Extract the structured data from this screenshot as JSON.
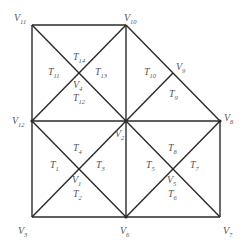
{
  "diagram": {
    "type": "triangulated-mesh",
    "colors": {
      "edge": "#2a2a2a",
      "label": "#555555",
      "background": "#ffffff"
    },
    "vertices": [
      {
        "id": "V1",
        "base": "V",
        "sub": "1",
        "x": 79,
        "y": 169,
        "lx": 72,
        "ly": 183
      },
      {
        "id": "V2",
        "base": "V",
        "sub": "2",
        "x": 126,
        "y": 121,
        "lx": 115,
        "ly": 137
      },
      {
        "id": "V3",
        "base": "V",
        "sub": "3",
        "x": 32,
        "y": 217,
        "lx": 18,
        "ly": 234
      },
      {
        "id": "V4",
        "base": "V",
        "sub": "4",
        "x": 79,
        "y": 73,
        "lx": 73,
        "ly": 88
      },
      {
        "id": "V5",
        "base": "V",
        "sub": "5",
        "x": 173,
        "y": 169,
        "lx": 167,
        "ly": 183
      },
      {
        "id": "V6",
        "base": "V",
        "sub": "6",
        "x": 126,
        "y": 217,
        "lx": 120,
        "ly": 234
      },
      {
        "id": "V7",
        "base": "V",
        "sub": "7",
        "x": 220,
        "y": 217,
        "lx": 223,
        "ly": 234
      },
      {
        "id": "V8",
        "base": "V",
        "sub": "8",
        "x": 220,
        "y": 121,
        "lx": 224,
        "ly": 121
      },
      {
        "id": "V9",
        "base": "V",
        "sub": "9",
        "x": 173,
        "y": 73,
        "lx": 176,
        "ly": 70
      },
      {
        "id": "V10",
        "base": "V",
        "sub": "10",
        "x": 126,
        "y": 25,
        "lx": 124,
        "ly": 21
      },
      {
        "id": "V11",
        "base": "V",
        "sub": "11",
        "x": 32,
        "y": 25,
        "lx": 14,
        "ly": 21
      },
      {
        "id": "V12",
        "base": "V",
        "sub": "12",
        "x": 32,
        "y": 121,
        "lx": 12,
        "ly": 124
      }
    ],
    "edges": [
      [
        "V11",
        "V10"
      ],
      [
        "V11",
        "V12"
      ],
      [
        "V12",
        "V3"
      ],
      [
        "V3",
        "V6"
      ],
      [
        "V6",
        "V7"
      ],
      [
        "V7",
        "V8"
      ],
      [
        "V10",
        "V9"
      ],
      [
        "V9",
        "V8"
      ],
      [
        "V10",
        "V2"
      ],
      [
        "V2",
        "V6"
      ],
      [
        "V12",
        "V2"
      ],
      [
        "V2",
        "V8"
      ],
      [
        "V11",
        "V2"
      ],
      [
        "V10",
        "V12"
      ],
      [
        "V12",
        "V6"
      ],
      [
        "V3",
        "V2"
      ],
      [
        "V2",
        "V7"
      ],
      [
        "V6",
        "V8"
      ],
      [
        "V9",
        "V2"
      ]
    ],
    "triangles": [
      {
        "id": "T1",
        "base": "T",
        "sub": "1",
        "lx": 50,
        "ly": 168
      },
      {
        "id": "T2",
        "base": "T",
        "sub": "2",
        "lx": 73,
        "ly": 197
      },
      {
        "id": "T3",
        "base": "T",
        "sub": "3",
        "lx": 96,
        "ly": 168
      },
      {
        "id": "T4",
        "base": "T",
        "sub": "4",
        "lx": 73,
        "ly": 151
      },
      {
        "id": "T5",
        "base": "T",
        "sub": "5",
        "lx": 146,
        "ly": 168
      },
      {
        "id": "T6",
        "base": "T",
        "sub": "6",
        "lx": 168,
        "ly": 197
      },
      {
        "id": "T7",
        "base": "T",
        "sub": "7",
        "lx": 190,
        "ly": 168
      },
      {
        "id": "T8",
        "base": "T",
        "sub": "8",
        "lx": 168,
        "ly": 151
      },
      {
        "id": "T9",
        "base": "T",
        "sub": "9",
        "lx": 169,
        "ly": 97
      },
      {
        "id": "T10",
        "base": "T",
        "sub": "10",
        "lx": 144,
        "ly": 75
      },
      {
        "id": "T11",
        "base": "T",
        "sub": "11",
        "lx": 48,
        "ly": 75
      },
      {
        "id": "T12",
        "base": "T",
        "sub": "12",
        "lx": 73,
        "ly": 101
      },
      {
        "id": "T13",
        "base": "T",
        "sub": "13",
        "lx": 95,
        "ly": 75
      },
      {
        "id": "T14",
        "base": "T",
        "sub": "14",
        "lx": 73,
        "ly": 60
      }
    ]
  }
}
